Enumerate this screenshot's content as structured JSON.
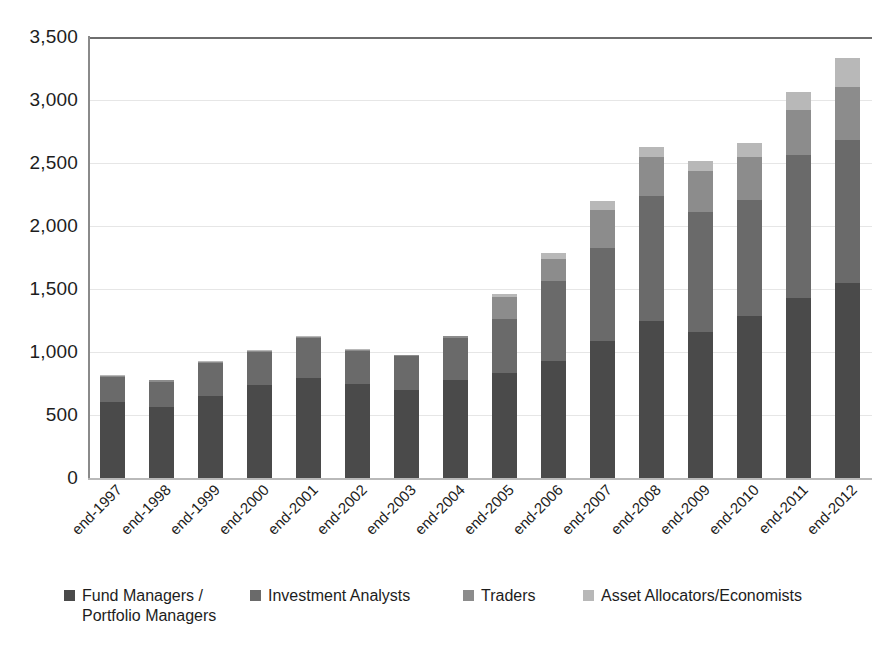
{
  "chart_data": {
    "type": "bar",
    "subtype": "stacked-bar",
    "title": "",
    "xlabel": "",
    "ylabel": "",
    "ylim": [
      0,
      3500
    ],
    "ytick_values": [
      0,
      500,
      1000,
      1500,
      2000,
      2500,
      3000,
      3500
    ],
    "ytick_labels": [
      "0",
      "500",
      "1,000",
      "1,500",
      "2,000",
      "2,500",
      "3,000",
      "3,500"
    ],
    "grid": true,
    "legend_position": "bottom",
    "categories": [
      "end-1997",
      "end-1998",
      "end-1999",
      "end-2000",
      "end-2001",
      "end-2002",
      "end-2003",
      "end-2004",
      "end-2005",
      "end-2006",
      "end-2007",
      "end-2008",
      "end-2009",
      "end-2010",
      "end-2011",
      "end-2012"
    ],
    "series": [
      {
        "name": "Fund Managers /\nPortfolio Managers",
        "color": "#4a4a4a",
        "values": [
          600,
          560,
          650,
          735,
          790,
          745,
          700,
          775,
          835,
          930,
          1085,
          1250,
          1155,
          1285,
          1430,
          1550
        ]
      },
      {
        "name": "Investment Analysts",
        "color": "#6a6a6a",
        "values": [
          200,
          205,
          260,
          265,
          320,
          265,
          265,
          340,
          430,
          630,
          740,
          990,
          955,
          925,
          1130,
          1130
        ]
      },
      {
        "name": "Traders",
        "color": "#8c8c8c",
        "values": [
          10,
          10,
          10,
          10,
          10,
          10,
          10,
          10,
          170,
          180,
          300,
          310,
          330,
          340,
          360,
          420
        ]
      },
      {
        "name": "Asset Allocators/Economists",
        "color": "#b8b8b8",
        "values": [
          5,
          5,
          5,
          5,
          5,
          5,
          5,
          5,
          25,
          45,
          75,
          80,
          80,
          110,
          145,
          230
        ]
      }
    ],
    "totals": [
      815,
      780,
      925,
      1015,
      1125,
      1025,
      980,
      1130,
      1460,
      1785,
      2200,
      2630,
      2520,
      2660,
      3065,
      3330
    ]
  },
  "legend": {
    "items": [
      {
        "label": "Fund Managers /\nPortfolio Managers",
        "color": "#4a4a4a"
      },
      {
        "label": "Investment Analysts",
        "color": "#6a6a6a"
      },
      {
        "label": "Traders",
        "color": "#8c8c8c"
      },
      {
        "label": "Asset Allocators/Economists",
        "color": "#b8b8b8"
      }
    ]
  },
  "colors": {
    "gridline": "#e6e6e6",
    "top_rule": "#6e6e6e",
    "axis": "#8a8a8a",
    "text": "#1d1d1d",
    "background": "#ffffff"
  }
}
